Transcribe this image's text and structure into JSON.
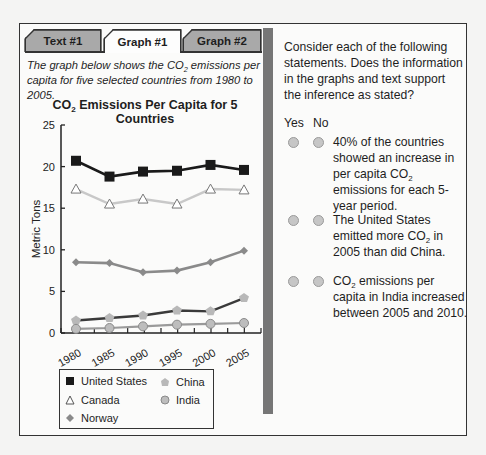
{
  "tabs": [
    {
      "label": "Text #1",
      "active": false
    },
    {
      "label": "Graph #1",
      "active": true
    },
    {
      "label": "Graph #2",
      "active": false
    }
  ],
  "left_panel": {
    "description_pre": "The graph below shows the CO",
    "description_sub": "2",
    "description_post": " emissions per capita for five selected countries from 1980 to 2005."
  },
  "chart_title": {
    "pre": "CO",
    "sub": "2",
    "post": " Emissions Per Capita for 5 Countries"
  },
  "legend": {
    "united_states": "United States",
    "canada": "Canada",
    "norway": "Norway",
    "china": "China",
    "india": "India"
  },
  "right_panel": {
    "prompt": "Consider each of the following statements. Does the information in the graphs and text support the inference as stated?",
    "yes_label": "Yes",
    "no_label": "No",
    "statements": [
      {
        "pre": "40% of the countries showed an increase in per capita CO",
        "sub": "2",
        "post": " emissions for each 5-year period."
      },
      {
        "pre": "The United States emitted more CO",
        "sub": "2",
        "post": " in 2005 than did China."
      },
      {
        "pre": "CO",
        "sub": "2",
        "post": " emissions per capita in India increased between 2005 and 2010."
      }
    ]
  },
  "colors": {
    "united_states": "#1a1a1a",
    "canada": "#c8c8c8",
    "norway": "#8a8a8a",
    "china_line": "#3a3a3a",
    "china_marker": "#b8b8b8",
    "india_line": "#9a9a9a",
    "india_marker": "#bdbdbd",
    "divider": "#767676",
    "tab_inactive": "#a9a9a9"
  },
  "chart_data": {
    "type": "line",
    "title": "CO2 Emissions Per Capita for 5 Countries",
    "xlabel": "",
    "ylabel": "Metric Tons",
    "x": [
      "1980",
      "1985",
      "1990",
      "1995",
      "2000",
      "2005"
    ],
    "ylim": [
      0,
      25
    ],
    "yticks": [
      0,
      5,
      10,
      15,
      20,
      25
    ],
    "grid": false,
    "legend_position": "bottom",
    "series": [
      {
        "name": "United States",
        "marker": "square",
        "values": [
          20.7,
          18.8,
          19.4,
          19.5,
          20.2,
          19.6
        ]
      },
      {
        "name": "Canada",
        "marker": "triangle-open",
        "values": [
          17.3,
          15.5,
          16.1,
          15.5,
          17.3,
          17.2
        ]
      },
      {
        "name": "Norway",
        "marker": "diamond",
        "values": [
          8.5,
          8.4,
          7.3,
          7.5,
          8.5,
          9.9
        ]
      },
      {
        "name": "China",
        "marker": "pentagon",
        "values": [
          1.5,
          1.8,
          2.1,
          2.7,
          2.6,
          4.2
        ]
      },
      {
        "name": "India",
        "marker": "circle",
        "values": [
          0.5,
          0.6,
          0.8,
          1.0,
          1.1,
          1.2
        ]
      }
    ]
  }
}
